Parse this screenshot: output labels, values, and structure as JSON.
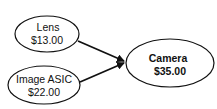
{
  "diagram": {
    "nodes": [
      {
        "id": "lens",
        "name": "Lens",
        "price": "$13.00"
      },
      {
        "id": "image_asic",
        "name": "Image ASIC",
        "price": "$22.00"
      },
      {
        "id": "camera",
        "name": "Camera",
        "price": "$35.00"
      }
    ],
    "edges": [
      {
        "from": "lens",
        "to": "camera"
      },
      {
        "from": "image_asic",
        "to": "camera"
      }
    ]
  }
}
